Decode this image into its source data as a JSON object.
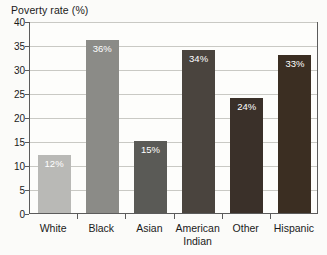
{
  "chart_data": {
    "type": "bar",
    "title": "Poverty rate (%)",
    "xlabel": "",
    "ylabel": "Poverty rate (%)",
    "categories": [
      "White",
      "Black",
      "Asian",
      "American Indian",
      "Other",
      "Hispanic"
    ],
    "values": [
      12,
      36,
      15,
      34,
      24,
      33
    ],
    "data_labels": [
      "12%",
      "36%",
      "15%",
      "34%",
      "24%",
      "33%"
    ],
    "ylim": [
      0,
      40
    ],
    "ytick_values": [
      0,
      5,
      10,
      15,
      20,
      25,
      30,
      35,
      40
    ],
    "ytick_labels": [
      "0",
      "5",
      "10",
      "15",
      "20",
      "25",
      "30",
      "35",
      "40"
    ],
    "grid": true,
    "legend": false,
    "bar_colors": [
      "#b9b9b6",
      "#8b8b87",
      "#5a5a56",
      "#4a443e",
      "#3a3029",
      "#3b2e22"
    ],
    "data_label_color": "#ffffff",
    "gridline_color": "#c9c9c4",
    "axis_color": "#5b5b5b",
    "background_color": "#fbfbf9"
  }
}
